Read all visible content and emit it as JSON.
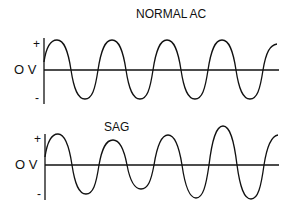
{
  "diagram": {
    "panels": [
      {
        "title": "NORMAL AC",
        "plus_label": "+",
        "zero_label": "O V",
        "minus_label": "-",
        "description": "constant-amplitude sine wave"
      },
      {
        "title": "SAG",
        "plus_label": "+",
        "zero_label": "O V",
        "minus_label": "-",
        "description": "sine wave with reduced amplitude in the middle cycles"
      }
    ],
    "colors": {
      "line": "#111111",
      "background": "#ffffff"
    }
  }
}
